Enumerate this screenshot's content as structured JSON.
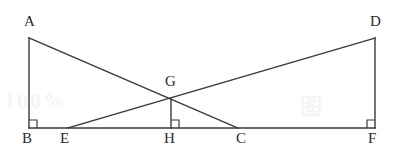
{
  "figure": {
    "kind": "geometry-diagram",
    "width": 404,
    "height": 165,
    "background_color": "#ffffff",
    "stroke_color": "#3a3a3a",
    "label_color": "#2b2b2b"
  },
  "labels": {
    "A": "A",
    "B": "B",
    "C": "C",
    "D": "D",
    "E": "E",
    "F": "F",
    "G": "G",
    "H": "H"
  },
  "watermark": {
    "left_text": "100%",
    "right_text": "图",
    "color": "#968c91"
  },
  "chart_data": {
    "type": "diagram",
    "title": "",
    "points": [
      {
        "name": "A",
        "x": 29,
        "y": 38
      },
      {
        "name": "B",
        "x": 29,
        "y": 128
      },
      {
        "name": "E",
        "x": 68,
        "y": 128
      },
      {
        "name": "G",
        "x": 171,
        "y": 99
      },
      {
        "name": "H",
        "x": 171,
        "y": 128
      },
      {
        "name": "C",
        "x": 238,
        "y": 128
      },
      {
        "name": "D",
        "x": 375,
        "y": 38
      },
      {
        "name": "F",
        "x": 375,
        "y": 128
      }
    ],
    "segments": [
      {
        "name": "AB",
        "from": "A",
        "to": "B"
      },
      {
        "name": "BF",
        "from": "B",
        "to": "F"
      },
      {
        "name": "DF",
        "from": "D",
        "to": "F"
      },
      {
        "name": "AC",
        "from": "A",
        "to": "C"
      },
      {
        "name": "ED",
        "from": "E",
        "to": "D"
      },
      {
        "name": "GH",
        "from": "G",
        "to": "H"
      }
    ],
    "right_angles": [
      {
        "name": "angle-B",
        "at": "B",
        "size": 8,
        "dir_x": 1,
        "dir_y": -1
      },
      {
        "name": "angle-H",
        "at": "H",
        "size": 8,
        "dir_x": 1,
        "dir_y": -1
      },
      {
        "name": "angle-F",
        "at": "F",
        "size": 8,
        "dir_x": -1,
        "dir_y": -1
      }
    ],
    "label_positions": [
      {
        "name": "A",
        "x": 24,
        "y": 14
      },
      {
        "name": "D",
        "x": 370,
        "y": 14
      },
      {
        "name": "G",
        "x": 165,
        "y": 74
      },
      {
        "name": "B",
        "x": 22,
        "y": 131
      },
      {
        "name": "E",
        "x": 60,
        "y": 131
      },
      {
        "name": "H",
        "x": 164,
        "y": 131
      },
      {
        "name": "C",
        "x": 236,
        "y": 131
      },
      {
        "name": "F",
        "x": 368,
        "y": 131
      }
    ]
  }
}
